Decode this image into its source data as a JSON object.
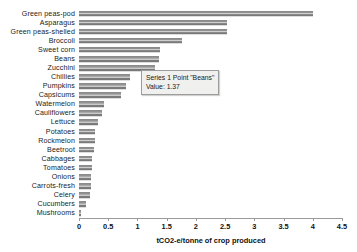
{
  "chart_data": {
    "type": "bar",
    "orientation": "horizontal",
    "title": "",
    "xlabel": "tCO2-e/tonne of crop produced",
    "ylabel": "",
    "xlim": [
      0,
      4.5
    ],
    "xticks": [
      "0",
      "0.5",
      "1",
      "1.5",
      "2",
      "2.5",
      "3",
      "3.5",
      "4",
      "4.5"
    ],
    "xtick_values": [
      0,
      0.5,
      1,
      1.5,
      2,
      2.5,
      3,
      3.5,
      4,
      4.5
    ],
    "grid": false,
    "legend": null,
    "series_name": "Series 1",
    "categories": [
      "Green peas-pod",
      "Asparagus",
      "Green peas-shelled",
      "Broccoli",
      "Sweet corn",
      "Beans",
      "Zucchini",
      "Chillies",
      "Pumpkins",
      "Capsicums",
      "Watermelon",
      "Cauliflowers",
      "Lettuce",
      "Potatoes",
      "Rockmelon",
      "Beetroot",
      "Cabbages",
      "Tomatoes",
      "Onions",
      "Carrots-fresh",
      "Celery",
      "Cucumbers",
      "Mushrooms"
    ],
    "values": [
      4.0,
      2.53,
      2.53,
      1.76,
      1.39,
      1.37,
      1.3,
      0.88,
      0.8,
      0.72,
      0.43,
      0.4,
      0.33,
      0.28,
      0.27,
      0.26,
      0.23,
      0.22,
      0.21,
      0.2,
      0.19,
      0.12,
      0.03
    ],
    "bar_color": "#8a8a8a"
  },
  "tooltip": {
    "line1": "Series 1 Point \"Beans\"",
    "line2": "Value: 1.37"
  },
  "axis": {
    "title": "tCO2-e/tonne of crop produced"
  }
}
